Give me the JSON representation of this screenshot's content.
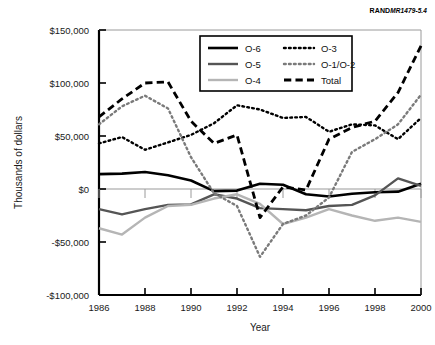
{
  "figure": {
    "source_note_brand": "RAND",
    "source_note_id": "MR1479-5.4"
  },
  "chart_data": {
    "type": "line",
    "title": "",
    "xlabel": "Year",
    "ylabel": "Thousands of dollars",
    "x": [
      1986,
      1987,
      1988,
      1989,
      1990,
      1991,
      1992,
      1993,
      1994,
      1995,
      1996,
      1997,
      1998,
      1999,
      2000
    ],
    "xlim": [
      1986,
      2000
    ],
    "ylim": [
      -100000,
      150000
    ],
    "xticks": [
      1986,
      1988,
      1990,
      1992,
      1994,
      1996,
      1998,
      2000
    ],
    "xtick_labels": [
      "1986",
      "1988",
      "1990",
      "1992",
      "1994",
      "1996",
      "1998",
      "2000"
    ],
    "yticks": [
      150000,
      100000,
      50000,
      0,
      -50000,
      -100000
    ],
    "ytick_labels": [
      "$150,000",
      "$100,000",
      "$50,000",
      "$0",
      "-$50,000",
      "-$100,000"
    ],
    "grid": false,
    "legend_position": "top-center",
    "series": [
      {
        "name": "O-6",
        "style": "solid",
        "color": "#000000",
        "width": 2.6,
        "values": [
          14000,
          14500,
          16000,
          13000,
          8000,
          -2000,
          -1500,
          5000,
          4000,
          -5000,
          -7000,
          -4500,
          -3000,
          -2500,
          5000
        ]
      },
      {
        "name": "O-5",
        "style": "solid",
        "color": "#555555",
        "width": 2.4,
        "values": [
          -19000,
          -24000,
          -19000,
          -15000,
          -14500,
          -5000,
          -9000,
          -18000,
          -19000,
          -20000,
          -16000,
          -15000,
          -6000,
          10000,
          3000
        ]
      },
      {
        "name": "O-4",
        "style": "solid",
        "color": "#b5b5b5",
        "width": 2.4,
        "values": [
          -37000,
          -43000,
          -27000,
          -16000,
          -15000,
          -9000,
          -5000,
          -14000,
          -33000,
          -27000,
          -19000,
          -25000,
          -30000,
          -27000,
          -31000
        ]
      },
      {
        "name": "O-3",
        "style": "dotted",
        "color": "#000000",
        "width": 2.4,
        "values": [
          43000,
          49000,
          37000,
          44000,
          51000,
          62000,
          79000,
          75000,
          67000,
          68000,
          54000,
          61000,
          60000,
          47000,
          67000
        ]
      },
      {
        "name": "O-1/O-2",
        "style": "dotted",
        "color": "#7a7a7a",
        "width": 2.4,
        "values": [
          61000,
          78000,
          88000,
          76000,
          30000,
          -4000,
          -16000,
          -64000,
          -33000,
          -25000,
          -8000,
          35000,
          47000,
          61000,
          89000
        ]
      },
      {
        "name": "Total",
        "style": "dashed",
        "color": "#000000",
        "width": 2.8,
        "values": [
          68000,
          85000,
          100000,
          101000,
          64000,
          43000,
          51000,
          -27000,
          2000,
          -1000,
          47000,
          58000,
          64000,
          91000,
          135000
        ]
      }
    ]
  }
}
